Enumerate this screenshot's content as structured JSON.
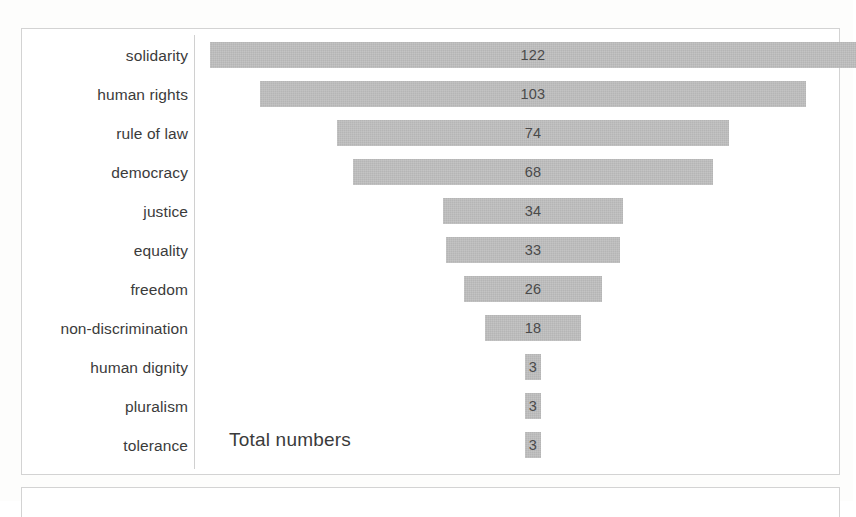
{
  "page": {
    "top_cut_text": "",
    "background_color": "#ffffff",
    "frame_border_color": "#d3d3d3"
  },
  "chart": {
    "caption": "Total numbers",
    "bar_color": "#b5b5b5",
    "label_color": "#3b3b3b",
    "value_color": "#4a4a4a"
  },
  "chart_data": {
    "type": "bar",
    "subtype": "funnel",
    "title": "",
    "subtitle": "",
    "xlabel": "",
    "ylabel": "",
    "annotations": [
      "Total numbers"
    ],
    "grid": false,
    "legend": false,
    "orientation": "horizontal-centered",
    "xlim": [
      0,
      122
    ],
    "categories": [
      "solidarity",
      "human rights",
      "rule of law",
      "democracy",
      "justice",
      "equality",
      "freedom",
      "non-discrimination",
      "human dignity",
      "pluralism",
      "tolerance"
    ],
    "values": [
      122,
      103,
      74,
      68,
      34,
      33,
      26,
      18,
      3,
      3,
      3
    ],
    "data_labels": [
      "122",
      "103",
      "74",
      "68",
      "34",
      "33",
      "26",
      "18",
      "3",
      "3",
      "3"
    ]
  }
}
